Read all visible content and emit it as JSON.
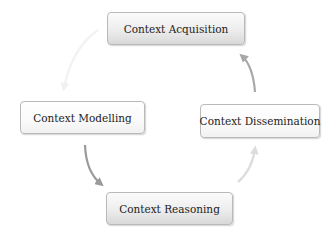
{
  "diagram": {
    "type": "cycle",
    "nodes": [
      {
        "id": "acquisition",
        "label": "Context Acquisition"
      },
      {
        "id": "modelling",
        "label": "Context Modelling"
      },
      {
        "id": "dissemination",
        "label": "Context Dissemination"
      },
      {
        "id": "reasoning",
        "label": "Context Reasoning"
      }
    ],
    "edges": [
      {
        "from": "acquisition",
        "to": "modelling",
        "color": "#f2f2f2"
      },
      {
        "from": "modelling",
        "to": "reasoning",
        "color": "#9a9a9a"
      },
      {
        "from": "reasoning",
        "to": "dissemination",
        "color": "#dcdcdc"
      },
      {
        "from": "dissemination",
        "to": "acquisition",
        "color": "#a8a8a8"
      }
    ]
  }
}
